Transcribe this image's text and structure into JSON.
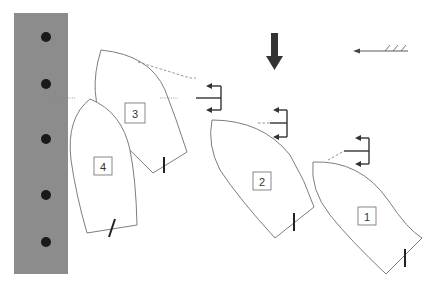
{
  "diagram": {
    "dock": {
      "x": 14,
      "y": 13,
      "width": 54,
      "height": 261,
      "color": "#8c8c8c",
      "bollards_y": [
        37,
        84,
        139,
        195,
        242
      ],
      "bollard_x": 46
    },
    "boats": [
      {
        "id": "boat-1",
        "label": "1",
        "label_x": 367,
        "label_y": 216
      },
      {
        "id": "boat-2",
        "label": "2",
        "label_x": 262,
        "label_y": 181
      },
      {
        "id": "boat-3",
        "label": "3",
        "label_x": 135,
        "label_y": 113
      },
      {
        "id": "boat-4",
        "label": "4",
        "label_x": 103,
        "label_y": 166
      }
    ],
    "current_arrow": {
      "direction": "down",
      "color": "#333333"
    },
    "wind_arrow": {
      "direction": "left",
      "color": "#444444"
    }
  }
}
